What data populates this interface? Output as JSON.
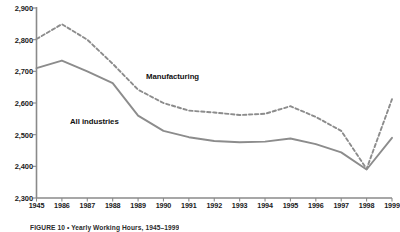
{
  "chart_data": {
    "type": "line",
    "title": "",
    "xlabel": "",
    "ylabel": "",
    "ylim": [
      2300,
      2900
    ],
    "ytick_step": 100,
    "grid": false,
    "legend_position": "inline-annotations",
    "categories": [
      "1945",
      "1986",
      "1987",
      "1988",
      "1989",
      "1990",
      "1991",
      "1992",
      "1993",
      "1994",
      "1995",
      "1996",
      "1997",
      "1998",
      "1999"
    ],
    "yticks": [
      "2,900",
      "2,800",
      "2,700",
      "2,600",
      "2,500",
      "2,400",
      "2,300"
    ],
    "ytick_values": [
      2900,
      2800,
      2700,
      2600,
      2500,
      2400,
      2300
    ],
    "series": [
      {
        "name": "Manufacturing",
        "style": "dashed",
        "color": "#8c8c8c",
        "values": [
          2802,
          2849,
          2800,
          2724,
          2642,
          2600,
          2576,
          2570,
          2562,
          2566,
          2590,
          2556,
          2512,
          2392,
          2612
        ]
      },
      {
        "name": "All industries",
        "style": "solid",
        "color": "#8c8c8c",
        "values": [
          2710,
          2734,
          2700,
          2663,
          2560,
          2512,
          2492,
          2480,
          2476,
          2478,
          2488,
          2470,
          2444,
          2390,
          2490
        ]
      }
    ],
    "annotations": [
      {
        "text": "Manufacturing",
        "x_pct": 36.5,
        "y_pct": 31.0
      },
      {
        "text": "All industries",
        "x_pct": 17.5,
        "y_pct": 50.5
      }
    ]
  },
  "caption": {
    "text": "FIGURE 10 • Yearly Working Hours, 1945–1999"
  },
  "colors": {
    "axis": "#8a8a8a",
    "line": "#8c8c8c",
    "text": "#1a1a1a",
    "background": "#ffffff"
  }
}
